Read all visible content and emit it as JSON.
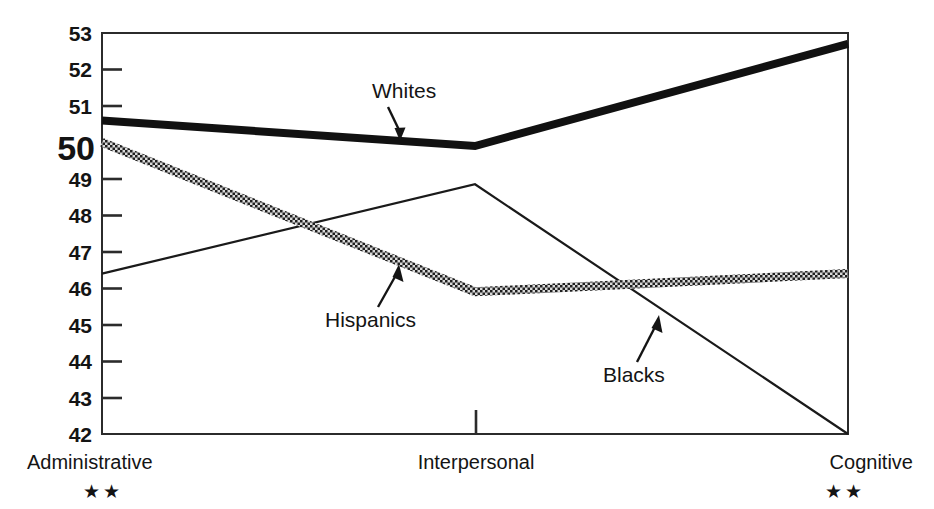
{
  "chart_data": {
    "type": "line",
    "title": "",
    "subtitle": "",
    "xlabel": "",
    "ylabel": "",
    "categories": [
      "Administrative",
      "Interpersonal",
      "Cognitive"
    ],
    "category_marks": [
      "**",
      "",
      "**"
    ],
    "ylim": [
      42,
      53
    ],
    "yticks": [
      42,
      43,
      44,
      45,
      46,
      47,
      48,
      49,
      50,
      51,
      52,
      53
    ],
    "ytick_labels": [
      "42",
      "43",
      "44",
      "45",
      "46",
      "47",
      "48",
      "49",
      "50",
      "51",
      "52",
      "53"
    ],
    "emphasized_ytick": "50",
    "grid": false,
    "legend_position": "inline-annotations",
    "series": [
      {
        "name": "Whites",
        "style": "thick-solid",
        "color": "#111111",
        "values": [
          50.6,
          49.9,
          52.7
        ]
      },
      {
        "name": "Hispanics",
        "style": "crosshatch-textured",
        "color": "#222222",
        "values": [
          50.0,
          45.9,
          46.4
        ]
      },
      {
        "name": "Blacks",
        "style": "thin-solid",
        "color": "#1a1a1a",
        "values": [
          46.4,
          48.85,
          42.0
        ]
      }
    ],
    "annotations": [
      {
        "text": "Whites",
        "points_to_series": "Whites"
      },
      {
        "text": "Hispanics",
        "points_to_series": "Hispanics"
      },
      {
        "text": "Blacks",
        "points_to_series": "Blacks"
      }
    ]
  },
  "axis": {
    "y_labels": [
      "53",
      "52",
      "51",
      "50",
      "49",
      "48",
      "47",
      "46",
      "45",
      "44",
      "43",
      "42"
    ],
    "x_labels": [
      "Administrative",
      "Interpersonal",
      "Cognitive"
    ],
    "x_marks_left": "★★",
    "x_marks_right": "★★"
  },
  "annotations": {
    "whites": "Whites",
    "hispanics": "Hispanics",
    "blacks": "Blacks"
  },
  "colors": {
    "frame": "#2b2b2b",
    "text": "#141414",
    "whites": "#111111",
    "hispanics": "#222222",
    "blacks": "#1a1a1a",
    "background": "#ffffff"
  }
}
